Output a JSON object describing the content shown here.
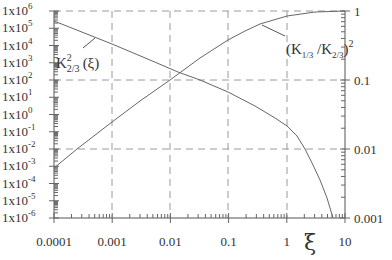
{
  "chart_data": {
    "type": "line",
    "title": "",
    "xlabel": "ξ",
    "ylabel_left": "",
    "ylabel_right": "",
    "x_scale": "log",
    "xlim": [
      0.0001,
      10
    ],
    "x_ticks": [
      "0.0001",
      "0.001",
      "0.01",
      "0.1",
      "1",
      "10"
    ],
    "y_left_scale": "log",
    "y_left_lim": [
      1e-06,
      1000000.0
    ],
    "y_left_ticks": [
      "1x10^6",
      "1x10^5",
      "1x10^4",
      "1x10^3",
      "1x10^2",
      "1x10^1",
      "1x10^0",
      "1x10^-1",
      "1x10^-2",
      "1x10^-3",
      "1x10^-4",
      "1x10^-5",
      "1x10^-6"
    ],
    "y_right_scale": "log",
    "y_right_lim": [
      0.001,
      1
    ],
    "y_right_ticks": [
      "1",
      "0.1",
      "0.01",
      "0.001"
    ],
    "grid": "dashed at major decades (x: every decade; y: 1e6/1, 1e2/0.1, 1e-2/0.01)",
    "series": [
      {
        "name": "K²₂/₃(ξ)",
        "axis": "left",
        "x": [
          0.0001,
          0.001,
          0.01,
          0.02,
          0.1,
          0.5,
          1,
          2,
          3,
          5,
          7
        ],
        "y": [
          250000.0,
          12000.0,
          600.0,
          250.0,
          27.0,
          2.5,
          0.5,
          0.04,
          0.003,
          3e-05,
          1e-06
        ]
      },
      {
        "name": "(K₁/₃/K₂/₃)²",
        "axis": "right",
        "x": [
          0.0001,
          0.0003,
          0.001,
          0.01,
          0.1,
          0.3,
          1,
          10
        ],
        "y": [
          0.0046,
          0.01,
          0.022,
          0.1,
          0.46,
          0.7,
          0.85,
          1.0
        ]
      }
    ],
    "annotations": [
      "K²₂/₃(ξ)",
      "(K₁/₃/K₂/₃)²"
    ]
  },
  "labels": {
    "x_ticks": [
      "0.0001",
      "0.001",
      "0.01",
      "0.1",
      "1",
      "10"
    ],
    "x_axis": "ξ",
    "y_left_base": "1x10",
    "y_left_exps": [
      "6",
      "5",
      "4",
      "3",
      "2",
      "1",
      "0",
      "-1",
      "-2",
      "-3",
      "-4",
      "-5",
      "-6"
    ],
    "y_right": [
      "1",
      "0.1",
      "0.01",
      "0.001"
    ],
    "curve1_main": "K",
    "curve1_sup": "2",
    "curve1_sub": "2/3",
    "curve1_arg": "(ξ)",
    "curve2_open": "(K",
    "curve2_sub1": "1/3",
    "curve2_mid": " /K",
    "curve2_sub2": "2/3",
    "curve2_close": ")",
    "curve2_sup": "2"
  },
  "colors": {
    "axis": "#555555",
    "grid": "#999999",
    "curve": "#666666",
    "text": "#333333"
  }
}
